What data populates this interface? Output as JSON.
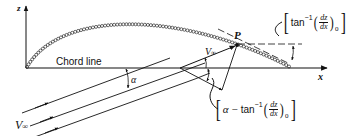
{
  "diagram": {
    "axes": {
      "z_label": "z",
      "x_label": "x"
    },
    "chord_label": "Chord line",
    "point_label": "P",
    "freestream_label_main": "V",
    "freestream_label_sub": "∞",
    "freestream_label_local_main": "V",
    "freestream_label_local_sub": "∞",
    "alpha_label": "α",
    "slope_bracket": {
      "prefix": "tan",
      "exponent": "−1",
      "numerator": "dz",
      "denominator": "dx",
      "subscript": "0"
    },
    "angle_bracket": {
      "alpha": "α",
      "minus": "−",
      "prefix": "tan",
      "exponent": "−1",
      "numerator": "dz",
      "denominator": "dx",
      "subscript": "0"
    },
    "colors": {
      "ink": "#111111",
      "background": "#ffffff"
    }
  }
}
